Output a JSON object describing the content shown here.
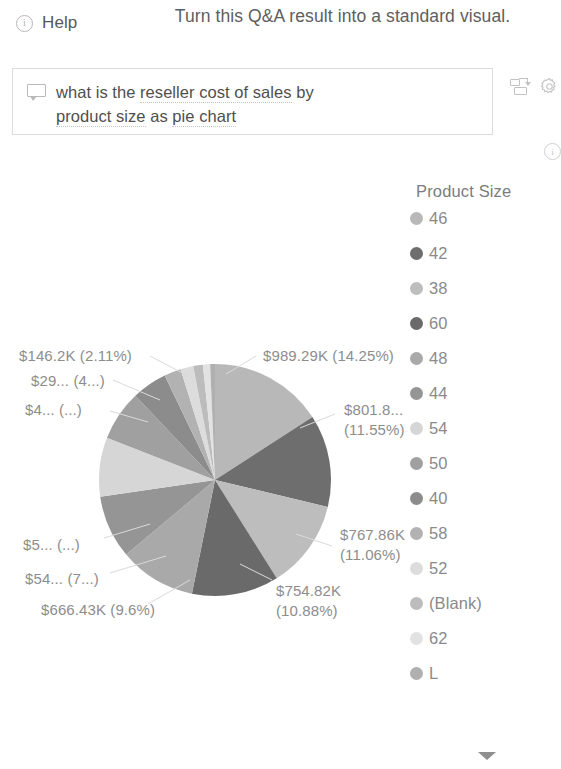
{
  "header": {
    "help_label": "Help",
    "help_icon": "info-circle-icon",
    "title": "Turn this Q&A result into a standard visual."
  },
  "qna": {
    "icon": "speech-bubble-icon",
    "query_line1_a": "what is the ",
    "query_line1_b": "reseller cost of sales",
    "query_line1_c": " by",
    "query_line2_a": "product size",
    "query_line2_b": " as ",
    "query_line2_c": "pie chart",
    "placeholder": "Ask a question about your data"
  },
  "toolbar": {
    "convert_icon": "convert-to-visual-icon",
    "settings_icon": "gear-icon",
    "info_icon": "info-circle-icon"
  },
  "legend": {
    "title": "Product Size",
    "items": [
      {
        "label": "46",
        "color": "#b8b8b8"
      },
      {
        "label": "42",
        "color": "#6e6e6e"
      },
      {
        "label": "38",
        "color": "#bdbdbd"
      },
      {
        "label": "60",
        "color": "#6a6a6a"
      },
      {
        "label": "48",
        "color": "#a9a9a9"
      },
      {
        "label": "44",
        "color": "#959595"
      },
      {
        "label": "54",
        "color": "#d6d6d6"
      },
      {
        "label": "50",
        "color": "#a0a0a0"
      },
      {
        "label": "40",
        "color": "#8c8c8c"
      },
      {
        "label": "58",
        "color": "#b2b2b2"
      },
      {
        "label": "52",
        "color": "#dcdcdc"
      },
      {
        "label": "(Blank)",
        "color": "#bcbcbc"
      },
      {
        "label": "62",
        "color": "#e2e2e2"
      },
      {
        "label": "L",
        "color": "#b0b0b0"
      }
    ]
  },
  "footer": {
    "chevron_icon": "chevron-down-icon"
  },
  "chart_data": {
    "type": "pie",
    "title": "",
    "legend_title": "Product Size",
    "legend_position": "right",
    "measure": "Reseller Cost of Sales",
    "category": "Product Size",
    "total_formatted": "$6.94M",
    "categories": [
      "46",
      "42",
      "38",
      "60",
      "48",
      "44",
      "54",
      "50",
      "40",
      "58",
      "52",
      "(Blank)",
      "62",
      "L"
    ],
    "values_formatted": [
      "$989.29K",
      "$801.8K",
      "$767.86K",
      "$754.82K",
      "$666.43K",
      "$54...",
      "$5...",
      "$4...",
      "$29...",
      "$146.2K",
      "",
      "",
      "",
      ""
    ],
    "percents": [
      14.25,
      11.55,
      11.06,
      10.88,
      9.6,
      7.9,
      7.4,
      6.3,
      4.4,
      2.11,
      1.6,
      1.2,
      0.9,
      0.6
    ],
    "colors": [
      "#b8b8b8",
      "#6e6e6e",
      "#bdbdbd",
      "#6a6a6a",
      "#a9a9a9",
      "#959595",
      "#d6d6d6",
      "#a0a0a0",
      "#8c8c8c",
      "#b2b2b2",
      "#dcdcdc",
      "#bcbcbc",
      "#e2e2e2",
      "#b0b0b0"
    ],
    "data_labels": [
      {
        "id": "lbl-46",
        "text": "$989.29K (14.25%)",
        "lines": [
          "$989.29K (14.25%)"
        ],
        "x": 263,
        "y": 346,
        "align": "left"
      },
      {
        "id": "lbl-42",
        "text": "$801.8... (11.55%)",
        "lines": [
          "$801.8...",
          "(11.55%)"
        ],
        "x": 344,
        "y": 400,
        "align": "left"
      },
      {
        "id": "lbl-38",
        "text": "$767.86K (11.06%)",
        "lines": [
          "$767.86K",
          "(11.06%)"
        ],
        "x": 340,
        "y": 525,
        "align": "left"
      },
      {
        "id": "lbl-60",
        "text": "$754.82K (10.88%)",
        "lines": [
          "$754.82K",
          "(10.88%)"
        ],
        "x": 276,
        "y": 581,
        "align": "left"
      },
      {
        "id": "lbl-48",
        "text": "$666.43K (9.6%)",
        "lines": [
          "$666.43K (9.6%)"
        ],
        "x": 41,
        "y": 600,
        "align": "left"
      },
      {
        "id": "lbl-44",
        "text": "$54... (7...)",
        "lines": [
          "$54... (7...)"
        ],
        "x": 25,
        "y": 569,
        "align": "left"
      },
      {
        "id": "lbl-54",
        "text": "$5... (...)",
        "lines": [
          "$5... (...)"
        ],
        "x": 23,
        "y": 535,
        "align": "left"
      },
      {
        "id": "lbl-50",
        "text": "$4... (...)",
        "lines": [
          "$4... (...)"
        ],
        "x": 25,
        "y": 400,
        "align": "left"
      },
      {
        "id": "lbl-40",
        "text": "$29... (4...)",
        "lines": [
          "$29... (4...)"
        ],
        "x": 31,
        "y": 371,
        "align": "left"
      },
      {
        "id": "lbl-58",
        "text": "$146.2K (2.11%)",
        "lines": [
          "$146.2K (2.11%)"
        ],
        "x": 19,
        "y": 346,
        "align": "left"
      }
    ],
    "grid": false,
    "start_angle_deg": 0,
    "direction": "clockwise"
  }
}
